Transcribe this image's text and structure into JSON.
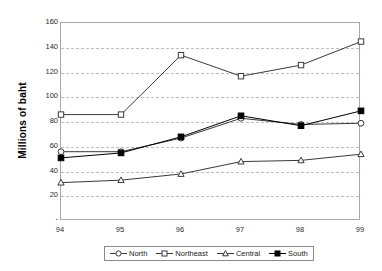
{
  "chart_data": {
    "type": "line",
    "title": "",
    "subtitle": "",
    "xlabel": "",
    "ylabel": "Millions of baht",
    "x": [
      "94",
      "95",
      "96",
      "97",
      "98",
      "99"
    ],
    "categories": [
      "94",
      "95",
      "96",
      "97",
      "98",
      "99"
    ],
    "series": [
      {
        "name": "North",
        "marker": "open-circle",
        "values": [
          56,
          56,
          67,
          83,
          78,
          79
        ]
      },
      {
        "name": "Northeast",
        "marker": "open-square",
        "values": [
          86,
          86,
          134,
          117,
          126,
          145
        ]
      },
      {
        "name": "Central",
        "marker": "open-triangle",
        "values": [
          31,
          33,
          38,
          48,
          49,
          54
        ]
      },
      {
        "name": "South",
        "marker": "filled-square",
        "values": [
          51,
          55,
          68,
          85,
          77,
          89
        ]
      }
    ],
    "ylim": [
      0,
      160
    ],
    "ytick_values": [
      0,
      20,
      40,
      60,
      80,
      100,
      120,
      140,
      160
    ],
    "ytick_labels": [
      "-",
      "20",
      "40",
      "60",
      "80",
      "100",
      "120",
      "140",
      "160"
    ],
    "grid": "horizontal-dashed",
    "legend_position": "bottom",
    "legend_entries": [
      "North",
      "Northeast",
      "Central",
      "South"
    ],
    "colors": {
      "series_line": "#3a3a3a",
      "gridline": "#c9b8c4",
      "frame": "#a8a8a8",
      "south_fill": "#000000",
      "open_fill": "#ffffff"
    }
  }
}
